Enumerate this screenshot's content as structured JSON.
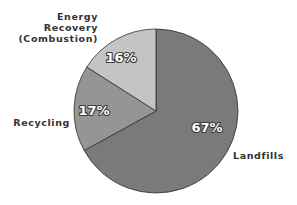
{
  "chart_data": {
    "type": "pie",
    "title": "",
    "categories": [
      "Landfills",
      "Recycling",
      "Energy Recovery (Combustion)"
    ],
    "values": [
      67,
      17,
      16
    ],
    "unit": "%",
    "slices": [
      {
        "name": "Landfills",
        "label_lines": [
          "Landfills"
        ],
        "value": 67,
        "value_label": "67%",
        "color": "#7a7a7a"
      },
      {
        "name": "Recycling",
        "label_lines": [
          "Recycling"
        ],
        "value": 17,
        "value_label": "17%",
        "color": "#959595"
      },
      {
        "name": "Energy Recovery (Combustion)",
        "label_lines": [
          "Energy",
          "Recovery",
          "(Combustion)"
        ],
        "value": 16,
        "value_label": "16%",
        "color": "#c4c4c4"
      }
    ],
    "legend": "none (direct labels)",
    "grid": false
  }
}
